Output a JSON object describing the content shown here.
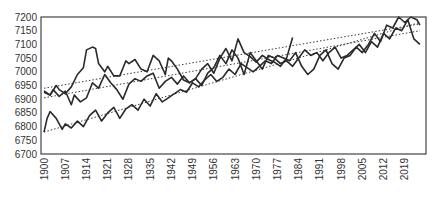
{
  "chart_data": {
    "type": "line",
    "title": "",
    "xlabel": "",
    "ylabel": "",
    "xlim": [
      1899,
      2026
    ],
    "ylim": [
      6700,
      7200
    ],
    "grid": false,
    "legend": "none",
    "y_ticks": [
      6700,
      6750,
      6800,
      6850,
      6900,
      6950,
      7000,
      7050,
      7100,
      7150,
      7200
    ],
    "y_tick_labels": [
      "6700",
      "6750",
      "6800",
      "6850",
      "6900",
      "6950",
      "7000",
      "7050",
      "7100",
      "7150",
      "7200"
    ],
    "x_ticks": [
      1900,
      1907,
      1914,
      1921,
      1928,
      1935,
      1942,
      1949,
      1956,
      1963,
      1970,
      1977,
      1984,
      1991,
      1998,
      2005,
      2012,
      2019
    ],
    "x_tick_labels": [
      "1900",
      "1907",
      "1914",
      "1921",
      "1928",
      "1935",
      "1942",
      "1949",
      "1956",
      "1963",
      "1970",
      "1977",
      "1984",
      "1991",
      "1998",
      "2005",
      "2012",
      "2019"
    ],
    "series": [
      {
        "name": "Series 1",
        "style": "solid",
        "color": "#2a2a2a",
        "x": [
          1900,
          1902,
          1904,
          1905,
          1907,
          1909,
          1911,
          1913,
          1914,
          1916,
          1917,
          1918,
          1920,
          1921,
          1923,
          1925,
          1927,
          1928,
          1930,
          1932,
          1934,
          1936,
          1938,
          1940,
          1941,
          1942,
          1944,
          1946,
          1948,
          1950,
          1952,
          1954,
          1956,
          1958,
          1960,
          1962,
          1964,
          1966,
          1968,
          1970,
          1972,
          1974,
          1976,
          1978,
          1980,
          1982
        ],
        "y": [
          6930,
          6915,
          6950,
          6935,
          6920,
          6945,
          6990,
          7015,
          7080,
          7090,
          7085,
          7030,
          7000,
          7020,
          6985,
          6985,
          7040,
          7030,
          7045,
          7010,
          7000,
          7060,
          7040,
          6990,
          7050,
          7040,
          7010,
          6970,
          6960,
          6975,
          7010,
          7030,
          6995,
          7050,
          7085,
          7040,
          7120,
          7070,
          7055,
          7035,
          7060,
          7045,
          7035,
          7020,
          7050,
          7125
        ]
      },
      {
        "name": "Series 2",
        "style": "solid",
        "color": "#2a2a2a",
        "x": [
          1900,
          1902,
          1903,
          1905,
          1907,
          1909,
          1910,
          1912,
          1914,
          1916,
          1918,
          1920,
          1922,
          1924,
          1926,
          1928,
          1930,
          1932,
          1934,
          1936,
          1938,
          1940,
          1942,
          1944,
          1946,
          1948,
          1950,
          1952,
          1954,
          1956,
          1958,
          1960,
          1962,
          1964,
          1966,
          1968,
          1970,
          1972,
          1974,
          1976,
          1978,
          1980,
          1982,
          1984,
          1986,
          1988,
          1990,
          1992,
          1994,
          1996,
          1998,
          2000,
          2002,
          2004,
          2006,
          2008,
          2010,
          2012,
          2014,
          2016,
          2018,
          2020,
          2022,
          2024
        ],
        "y": [
          6925,
          6915,
          6935,
          6910,
          6930,
          6880,
          6915,
          6890,
          6905,
          6960,
          6940,
          6990,
          6960,
          6935,
          6900,
          6955,
          6975,
          6965,
          6985,
          6995,
          6940,
          6965,
          6980,
          6955,
          6985,
          6960,
          6975,
          6950,
          6995,
          7015,
          7060,
          7030,
          7080,
          7050,
          6990,
          7070,
          7040,
          7010,
          7060,
          7050,
          7030,
          7040,
          7020,
          7050,
          7080,
          7060,
          7070,
          7040,
          7070,
          7090,
          7050,
          7060,
          7080,
          7100,
          7070,
          7110,
          7090,
          7140,
          7120,
          7160,
          7150,
          7190,
          7120,
          7100
        ]
      },
      {
        "name": "Series 3",
        "style": "solid",
        "color": "#2a2a2a",
        "x": [
          1900,
          1901,
          1902,
          1904,
          1906,
          1907,
          1909,
          1911,
          1913,
          1915,
          1917,
          1919,
          1921,
          1923,
          1925,
          1927,
          1929,
          1931,
          1933,
          1935,
          1937,
          1939,
          1941,
          1943,
          1945,
          1947,
          1949,
          1951,
          1953,
          1955,
          1957,
          1959,
          1961,
          1963,
          1965,
          1967,
          1969,
          1971,
          1973,
          1975,
          1977,
          1979,
          1981,
          1983,
          1985,
          1987,
          1989,
          1991,
          1993,
          1995,
          1997,
          1999,
          2001,
          2003,
          2005,
          2007,
          2009,
          2011,
          2013,
          2015,
          2017,
          2019,
          2021,
          2023,
          2024
        ],
        "y": [
          6780,
          6830,
          6855,
          6830,
          6790,
          6810,
          6795,
          6820,
          6800,
          6840,
          6860,
          6820,
          6850,
          6870,
          6830,
          6865,
          6880,
          6860,
          6900,
          6875,
          6920,
          6890,
          6905,
          6920,
          6935,
          6925,
          6960,
          6945,
          6970,
          6990,
          6965,
          6980,
          7010,
          6990,
          7030,
          7015,
          7000,
          7020,
          7040,
          7030,
          7060,
          7050,
          7040,
          7070,
          7020,
          6990,
          7010,
          7060,
          7080,
          7030,
          7010,
          7050,
          7060,
          7090,
          7070,
          7100,
          7140,
          7110,
          7170,
          7160,
          7200,
          7180,
          7200,
          7190,
          7170
        ]
      }
    ],
    "trendlines": [
      {
        "name": "Series 1 trend",
        "style": "dotted",
        "x": [
          1900,
          2024
        ],
        "y": [
          6940,
          7175
        ]
      },
      {
        "name": "Series 2 trend",
        "style": "dotted",
        "x": [
          1900,
          2024
        ],
        "y": [
          6905,
          7150
        ]
      },
      {
        "name": "Series 3 trend",
        "style": "dotted",
        "x": [
          1900,
          2024
        ],
        "y": [
          6780,
          7180
        ]
      }
    ]
  }
}
